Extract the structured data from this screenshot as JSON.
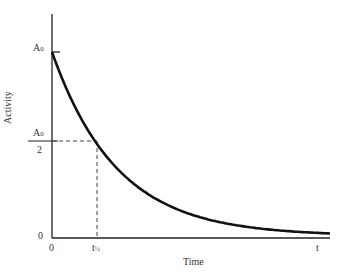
{
  "chart_data": {
    "type": "line",
    "title": "",
    "xlabel": "Time",
    "ylabel": "Activity",
    "x_ticks": [
      "0",
      "t½",
      "t"
    ],
    "y_ticks": [
      "0",
      "A0/2",
      "A0"
    ],
    "series": [
      {
        "name": "Activity decay",
        "function": "A(t) = A0 * exp(-ln2 * t / t_half)",
        "x": [
          0,
          0.5,
          1,
          2,
          3,
          4,
          5,
          6
        ],
        "values": [
          1.0,
          0.71,
          0.5,
          0.25,
          0.125,
          0.0625,
          0.031,
          0.016
        ]
      }
    ],
    "annotations": [
      "dashed horizontal line at A0/2",
      "dashed vertical line at t½"
    ],
    "grid": false,
    "legend": "none"
  },
  "labels": {
    "y_top": "A",
    "y_top_sub": "0",
    "y_half_num": "A",
    "y_half_num_sub": "0",
    "y_half_den": "2",
    "y_zero": "0",
    "x_zero": "0",
    "x_half": "t",
    "x_half_sub": "½",
    "x_end": "t",
    "xlabel": "Time",
    "ylabel": "Activity"
  }
}
